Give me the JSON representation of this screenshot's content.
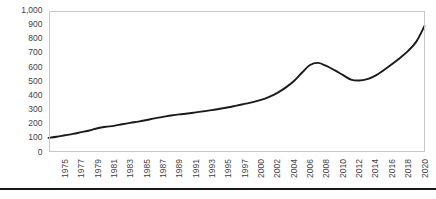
{
  "chart_data": {
    "type": "line",
    "title": "",
    "subtitle": "",
    "xlabel": "",
    "ylabel": "",
    "ylim": [
      0,
      1000
    ],
    "y_ticks": [
      "0",
      "100",
      "200",
      "300",
      "400",
      "500",
      "600",
      "700",
      "800",
      "900",
      "1,000"
    ],
    "y_tick_values": [
      0,
      100,
      200,
      300,
      400,
      500,
      600,
      700,
      800,
      900,
      1000
    ],
    "grid": false,
    "legend": "none",
    "line_color": "#1a1a1a",
    "plot_border_color": "#c8c8c8",
    "axis_text_color": "#3f3f3f",
    "x_tick_labels": [
      "1975",
      "1977",
      "1979",
      "1981",
      "1983",
      "1985",
      "1987",
      "1989",
      "1991",
      "1993",
      "1995",
      "1997",
      "2000",
      "2002",
      "2004",
      "2006",
      "2008",
      "2010",
      "2012",
      "2014",
      "2016",
      "2018",
      "2020"
    ],
    "x": [
      1975,
      1976,
      1977,
      1978,
      1979,
      1980,
      1981,
      1982,
      1983,
      1984,
      1985,
      1986,
      1987,
      1988,
      1989,
      1990,
      1991,
      1992,
      1993,
      1994,
      1995,
      1996,
      1997,
      1998,
      1999,
      2000,
      2001,
      2002,
      2003,
      2004,
      2005,
      2006,
      2007,
      2008,
      2009,
      2010,
      2011,
      2012,
      2013,
      2014,
      2015,
      2016,
      2017,
      2018,
      2019,
      2020,
      2021
    ],
    "values": [
      100,
      108,
      118,
      128,
      140,
      152,
      168,
      178,
      185,
      196,
      206,
      215,
      226,
      238,
      248,
      258,
      266,
      272,
      280,
      288,
      296,
      306,
      316,
      328,
      340,
      352,
      368,
      390,
      418,
      455,
      500,
      560,
      615,
      630,
      608,
      578,
      545,
      512,
      505,
      515,
      540,
      578,
      620,
      665,
      715,
      780,
      890
    ]
  }
}
